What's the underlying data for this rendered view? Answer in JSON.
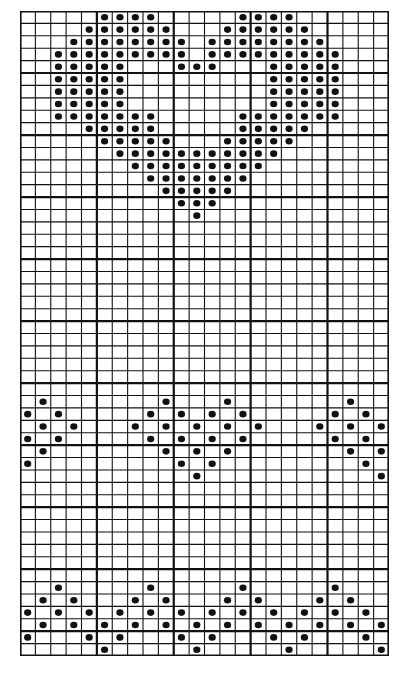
{
  "chart": {
    "title": "",
    "type": "knitting-chart",
    "columns": 24,
    "rows": 52,
    "major_every": 5,
    "colors": {
      "background": "#ffffff",
      "grid": "#111111",
      "stitch": "#111111"
    },
    "stitch_symbol": "dot",
    "motifs": [
      {
        "name": "heart",
        "rows": {
          "0": [
            5,
            6,
            7,
            8,
            14,
            15,
            16,
            17
          ],
          "1": [
            4,
            5,
            6,
            7,
            8,
            9,
            13,
            14,
            15,
            16,
            17,
            18
          ],
          "2": [
            3,
            4,
            5,
            6,
            7,
            8,
            9,
            10,
            12,
            13,
            14,
            15,
            16,
            17,
            18,
            19
          ],
          "3": [
            2,
            3,
            4,
            5,
            6,
            7,
            8,
            9,
            10,
            12,
            13,
            14,
            15,
            16,
            17,
            18,
            19,
            20
          ],
          "4": [
            2,
            3,
            4,
            5,
            6,
            10,
            11,
            12,
            16,
            17,
            18,
            19,
            20
          ],
          "5": [
            2,
            3,
            4,
            5,
            6,
            16,
            17,
            18,
            19,
            20
          ],
          "6": [
            2,
            3,
            4,
            5,
            6,
            16,
            17,
            18,
            19,
            20
          ],
          "7": [
            2,
            3,
            4,
            5,
            6,
            16,
            17,
            18,
            19,
            20
          ],
          "8": [
            2,
            3,
            4,
            5,
            6,
            7,
            8,
            14,
            15,
            16,
            17,
            18,
            19,
            20
          ],
          "9": [
            4,
            5,
            6,
            7,
            8,
            14,
            15,
            16,
            17,
            18
          ],
          "10": [
            5,
            6,
            7,
            8,
            9,
            13,
            14,
            15,
            16,
            17
          ],
          "11": [
            6,
            7,
            8,
            9,
            10,
            11,
            12,
            13,
            14,
            15,
            16
          ],
          "12": [
            7,
            8,
            9,
            10,
            11,
            12,
            13,
            14,
            15
          ],
          "13": [
            8,
            9,
            10,
            11,
            12,
            13,
            14
          ],
          "14": [
            9,
            10,
            11,
            12,
            13
          ],
          "15": [
            10,
            11,
            12
          ],
          "16": [
            11
          ]
        }
      },
      {
        "name": "diamond-band",
        "rows": {
          "31": [
            1,
            9,
            13,
            21
          ],
          "32": [
            0,
            2,
            8,
            10,
            12,
            14,
            20,
            22
          ],
          "33": [
            1,
            3,
            7,
            9,
            11,
            13,
            15,
            19,
            21,
            23
          ],
          "34": [
            0,
            2,
            8,
            10,
            12,
            14,
            20,
            22
          ],
          "35": [
            1,
            9,
            11,
            13,
            21,
            23
          ],
          "36": [
            0,
            10,
            12,
            22
          ],
          "37": [
            11,
            23
          ]
        }
      },
      {
        "name": "wave-border",
        "rows": {
          "46": [
            2,
            8,
            14,
            20
          ],
          "47": [
            1,
            3,
            7,
            9,
            13,
            15,
            19,
            21
          ],
          "48": [
            0,
            2,
            4,
            6,
            8,
            10,
            12,
            14,
            16,
            18,
            20,
            22
          ],
          "49": [
            1,
            3,
            5,
            7,
            9,
            11,
            13,
            15,
            17,
            19,
            21,
            23
          ],
          "50": [
            0,
            4,
            6,
            10,
            12,
            16,
            18,
            22
          ],
          "51": [
            5,
            11,
            17,
            23
          ]
        }
      }
    ]
  }
}
